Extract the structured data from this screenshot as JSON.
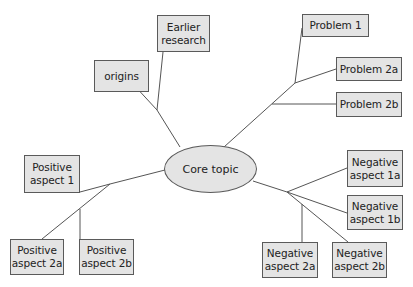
{
  "diagram": {
    "type": "mind-map",
    "colors": {
      "node_fill": "#e4e4e4",
      "node_border": "#5a5a5a",
      "line": "#555555",
      "text": "#222222"
    },
    "core": {
      "label": "Core topic"
    },
    "nodes": {
      "origins": "origins",
      "earlier_research": "Earlier\nresearch",
      "problem_1": "Problem 1",
      "problem_2a": "Problem 2a",
      "problem_2b": "Problem 2b",
      "positive_1": "Positive\naspect 1",
      "positive_2a": "Positive\naspect 2a",
      "positive_2b": "Positive\naspect 2b",
      "negative_1a": "Negative\naspect 1a",
      "negative_1b": "Negative\naspect 1b",
      "negative_2a": "Negative\naspect 2a",
      "negative_2b": "Negative\naspect 2b"
    },
    "branches": [
      {
        "name": "history",
        "children": [
          "origins",
          "Earlier research"
        ]
      },
      {
        "name": "problems",
        "children": [
          "Problem 1",
          "Problem 2a",
          "Problem 2b"
        ]
      },
      {
        "name": "positives",
        "children": [
          "Positive aspect 1",
          "Positive aspect 2a",
          "Positive aspect 2b"
        ]
      },
      {
        "name": "negatives",
        "children": [
          "Negative aspect 1a",
          "Negative aspect 1b",
          "Negative aspect 2a",
          "Negative aspect 2b"
        ]
      }
    ]
  }
}
